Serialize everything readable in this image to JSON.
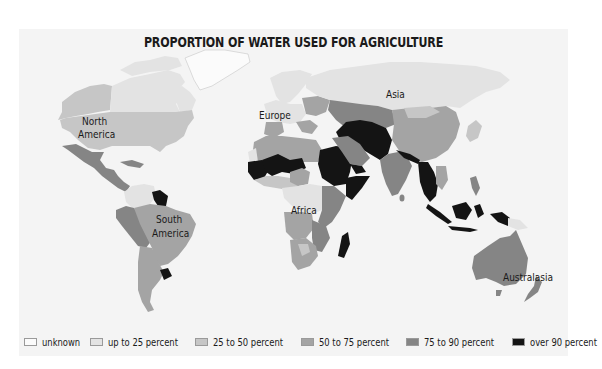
{
  "title": "PROPORTION OF WATER USED FOR AGRICULTURE",
  "colors": {
    "background": "#f4f4f4",
    "unknown": "#fbfbfb",
    "up_to_25": "#e3e3e3",
    "25_to_50": "#c6c6c6",
    "50_to_75": "#a4a4a4",
    "75_to_90": "#858585",
    "over_90": "#141414",
    "ocean": "#f4f4f4"
  },
  "region_labels": [
    {
      "name": "North America",
      "lines": [
        "North",
        "America"
      ]
    },
    {
      "name": "Europe",
      "lines": [
        "Europe"
      ]
    },
    {
      "name": "Asia",
      "lines": [
        "Asia"
      ]
    },
    {
      "name": "Africa",
      "lines": [
        "Africa"
      ]
    },
    {
      "name": "South America",
      "lines": [
        "South",
        "America"
      ]
    },
    {
      "name": "Australasia",
      "lines": [
        "Australasia"
      ]
    }
  ],
  "legend": [
    {
      "label": "unknown",
      "key": "unknown"
    },
    {
      "label": "up to 25 percent",
      "key": "up_to_25"
    },
    {
      "label": "25 to 50 percent",
      "key": "25_to_50"
    },
    {
      "label": "50 to 75 percent",
      "key": "50_to_75"
    },
    {
      "label": "75 to 90 percent",
      "key": "75_to_90"
    },
    {
      "label": "over 90 percent",
      "key": "over_90"
    }
  ]
}
